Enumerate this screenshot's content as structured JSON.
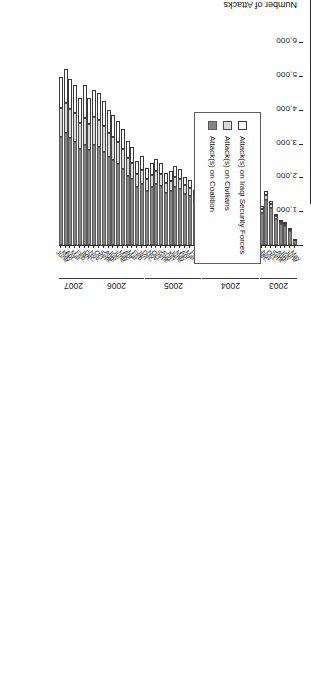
{
  "chart_data": {
    "type": "bar",
    "subtype": "stacked-horizontal",
    "title": "",
    "xlabel": "",
    "ylabel": "Number of Attacks",
    "orientation": "page-rotated-90",
    "ylim": [
      0,
      6000
    ],
    "yticks": [
      "0",
      "1,000",
      "2,000",
      "3,000",
      "4,000",
      "5,000",
      "6,000"
    ],
    "ytick_values": [
      0,
      1000,
      2000,
      3000,
      4000,
      5000,
      6000
    ],
    "grid": false,
    "legend_position": "inside-lower-left",
    "legend": [
      "Attack(s) on Iraqi Security Forces",
      "Attack(s) on Civilians",
      "Attack(s) on Coalition"
    ],
    "colors": {
      "Attack(s) on Iraqi Security Forces": "#ffffff",
      "Attack(s) on Civilians": "#d9d9d9",
      "Attack(s) on Coalition": "#858585",
      "axis": "#2b2b2b"
    },
    "year_groups": [
      {
        "label": "2003",
        "start_index": 0,
        "end_index": 7
      },
      {
        "label": "2004",
        "start_index": 8,
        "end_index": 19
      },
      {
        "label": "2005",
        "start_index": 20,
        "end_index": 31
      },
      {
        "label": "2006",
        "start_index": 32,
        "end_index": 43
      },
      {
        "label": "2007",
        "start_index": 44,
        "end_index": 49
      }
    ],
    "categories": [
      "May",
      "June",
      "July",
      "Aug.",
      "Sept.",
      "Oct.",
      "Nov.",
      "Dec.",
      "Jan.",
      "Feb.",
      "Mar.",
      "Apr.",
      "May",
      "June",
      "July",
      "Aug.",
      "Sept.",
      "Oct.",
      "Nov.",
      "Dec.",
      "Jan.",
      "Feb.",
      "Mar.",
      "Apr.",
      "May",
      "June",
      "July",
      "Aug.",
      "Sept.",
      "Oct.",
      "Nov.",
      "Dec.",
      "Jan.",
      "Feb.",
      "Mar.",
      "Apr.",
      "May",
      "June",
      "July",
      "Aug.",
      "Sept.",
      "Oct.",
      "Nov.",
      "Dec.",
      "Jan.",
      "Feb.",
      "Mar.",
      "Apr.",
      "May",
      "June"
    ],
    "series": [
      {
        "name": "Attack(s) on Coalition",
        "values": [
          150,
          420,
          560,
          620,
          760,
          1080,
          1320,
          950,
          820,
          760,
          980,
          1900,
          1750,
          1380,
          1150,
          1200,
          1450,
          1600,
          1550,
          1350,
          1300,
          1250,
          1450,
          1500,
          1650,
          1700,
          1600,
          1550,
          1750,
          1800,
          1700,
          1600,
          1800,
          1700,
          1950,
          2050,
          2250,
          2400,
          2500,
          2600,
          2750,
          2900,
          2950,
          2800,
          2950,
          2850,
          3050,
          3150,
          3300,
          3200
        ]
      },
      {
        "name": "Attack(s) on Civilians",
        "values": [
          20,
          40,
          60,
          70,
          90,
          120,
          150,
          110,
          100,
          95,
          120,
          180,
          200,
          170,
          150,
          160,
          200,
          230,
          220,
          200,
          210,
          200,
          240,
          260,
          300,
          320,
          300,
          290,
          340,
          380,
          360,
          340,
          420,
          400,
          480,
          520,
          600,
          640,
          680,
          700,
          760,
          800,
          820,
          780,
          800,
          760,
          840,
          880,
          900,
          840
        ]
      },
      {
        "name": "Attack(s) on Iraqi Security Forces",
        "values": [
          10,
          30,
          50,
          60,
          80,
          110,
          140,
          100,
          90,
          85,
          110,
          170,
          190,
          160,
          140,
          150,
          190,
          220,
          210,
          190,
          200,
          190,
          230,
          250,
          290,
          310,
          290,
          280,
          330,
          370,
          350,
          330,
          410,
          390,
          470,
          510,
          590,
          630,
          670,
          690,
          750,
          790,
          810,
          770,
          990,
          740,
          830,
          870,
          1000,
          940
        ]
      }
    ]
  }
}
